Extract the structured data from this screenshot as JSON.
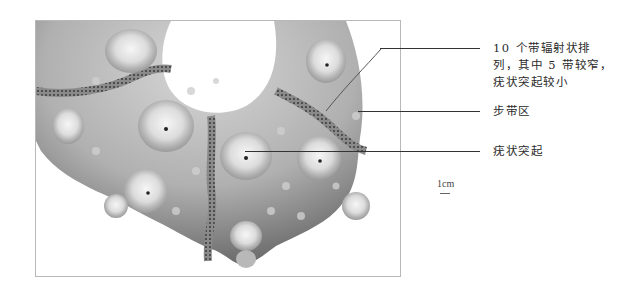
{
  "figure": {
    "annotations": [
      {
        "id": "radial-bands",
        "lines": [
          "10 个带辐射状排",
          "列，其中 5 带较窄，",
          "疣状突起较小"
        ]
      },
      {
        "id": "ambulacral-zone",
        "lines": [
          "步带区"
        ]
      },
      {
        "id": "tubercle",
        "lines": [
          "疣状突起"
        ]
      }
    ],
    "scale": {
      "label": "1cm"
    }
  },
  "colors": {
    "frame": "#b8b8b8",
    "leader": "#333333",
    "text": "#2a2a2a"
  }
}
